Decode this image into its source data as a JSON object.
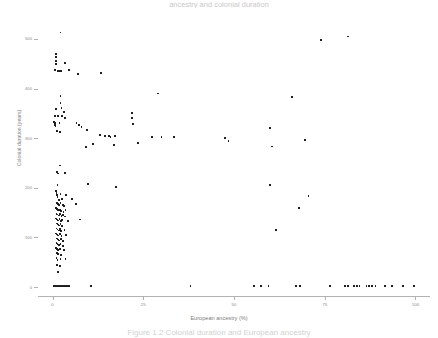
{
  "figure": {
    "top_title_fragment": "ancestry and colonial duration",
    "caption_fragment": "Figure 1.2 Colonial duration and European ancestry"
  },
  "chart_data": {
    "type": "scatter",
    "title": "",
    "xlabel": "European ancestry (%)",
    "ylabel": "Colonial duration (years)",
    "xlim": [
      -4,
      104
    ],
    "ylim": [
      -18,
      530
    ],
    "grid": false,
    "legend": null,
    "xticks": [
      0,
      25,
      50,
      75,
      100
    ],
    "xtick_labels": [
      "0",
      "25",
      "50",
      "75",
      "100"
    ],
    "yticks": [
      0,
      100,
      200,
      300,
      400,
      500
    ],
    "ytick_labels": [
      "0",
      "100",
      "200",
      "300",
      "400",
      "500"
    ],
    "marker": "square",
    "marker_color": "#1b1b1b",
    "marker_size": 1.8,
    "points": [
      [
        2.2,
        513
      ],
      [
        81.5,
        505
      ],
      [
        74.0,
        497
      ],
      [
        0.9,
        470
      ],
      [
        0.9,
        463
      ],
      [
        1.0,
        456
      ],
      [
        0.9,
        449
      ],
      [
        3.4,
        451
      ],
      [
        0.6,
        437
      ],
      [
        1.6,
        436
      ],
      [
        2.1,
        436
      ],
      [
        2.4,
        436
      ],
      [
        4.6,
        437
      ],
      [
        7.0,
        430
      ],
      [
        13.3,
        432
      ],
      [
        2.2,
        385
      ],
      [
        2.2,
        371
      ],
      [
        66.0,
        383
      ],
      [
        29.0,
        390
      ],
      [
        1.0,
        358
      ],
      [
        2.5,
        360
      ],
      [
        3.2,
        352
      ],
      [
        0.7,
        344
      ],
      [
        1.6,
        344
      ],
      [
        2.7,
        345
      ],
      [
        3.4,
        341
      ],
      [
        22.0,
        350
      ],
      [
        22.0,
        340
      ],
      [
        0.5,
        333
      ],
      [
        0.7,
        331
      ],
      [
        0.6,
        327
      ],
      [
        0.8,
        324
      ],
      [
        1.9,
        330
      ],
      [
        22.2,
        328
      ],
      [
        6.6,
        330
      ],
      [
        7.3,
        326
      ],
      [
        8.0,
        322
      ],
      [
        1.3,
        315
      ],
      [
        2.1,
        312
      ],
      [
        9.5,
        316
      ],
      [
        60.0,
        320
      ],
      [
        13.0,
        306
      ],
      [
        14.5,
        304
      ],
      [
        15.5,
        305
      ],
      [
        16.0,
        303
      ],
      [
        17.3,
        305
      ],
      [
        27.5,
        303
      ],
      [
        30.0,
        302
      ],
      [
        33.5,
        303
      ],
      [
        47.5,
        300
      ],
      [
        48.5,
        294
      ],
      [
        69.5,
        297
      ],
      [
        23.5,
        291
      ],
      [
        11.2,
        289
      ],
      [
        17.0,
        287
      ],
      [
        9.3,
        282
      ],
      [
        60.5,
        283
      ],
      [
        2.0,
        245
      ],
      [
        1.3,
        232
      ],
      [
        1.5,
        229
      ],
      [
        3.4,
        230
      ],
      [
        1.4,
        205
      ],
      [
        9.8,
        208
      ],
      [
        17.5,
        202
      ],
      [
        60.0,
        205
      ],
      [
        1.0,
        193
      ],
      [
        1.1,
        189
      ],
      [
        1.2,
        185
      ],
      [
        1.4,
        182
      ],
      [
        2.2,
        188
      ],
      [
        3.8,
        186
      ],
      [
        1.8,
        176
      ],
      [
        2.6,
        177
      ],
      [
        5.3,
        178
      ],
      [
        70.5,
        184
      ],
      [
        1.2,
        170
      ],
      [
        1.5,
        168
      ],
      [
        1.8,
        166
      ],
      [
        2.2,
        170
      ],
      [
        2.8,
        166
      ],
      [
        3.1,
        163
      ],
      [
        6.5,
        167
      ],
      [
        1.0,
        159
      ],
      [
        1.3,
        157
      ],
      [
        1.6,
        155
      ],
      [
        2.0,
        156
      ],
      [
        2.4,
        153
      ],
      [
        3.0,
        152
      ],
      [
        3.6,
        155
      ],
      [
        68.0,
        160
      ],
      [
        1.1,
        148
      ],
      [
        1.4,
        146
      ],
      [
        1.7,
        144
      ],
      [
        2.1,
        147
      ],
      [
        2.5,
        143
      ],
      [
        2.9,
        145
      ],
      [
        3.5,
        142
      ],
      [
        1.0,
        138
      ],
      [
        1.3,
        136
      ],
      [
        1.6,
        134
      ],
      [
        1.9,
        137
      ],
      [
        2.3,
        133
      ],
      [
        2.7,
        135
      ],
      [
        4.2,
        133
      ],
      [
        7.5,
        136
      ],
      [
        1.2,
        128
      ],
      [
        1.5,
        126
      ],
      [
        1.8,
        124
      ],
      [
        2.2,
        127
      ],
      [
        2.6,
        123
      ],
      [
        1.1,
        118
      ],
      [
        1.4,
        116
      ],
      [
        1.7,
        114
      ],
      [
        2.0,
        117
      ],
      [
        2.4,
        113
      ],
      [
        3.3,
        115
      ],
      [
        61.5,
        115
      ],
      [
        1.0,
        108
      ],
      [
        1.3,
        106
      ],
      [
        1.6,
        104
      ],
      [
        2.1,
        107
      ],
      [
        2.5,
        103
      ],
      [
        3.8,
        105
      ],
      [
        1.2,
        98
      ],
      [
        1.5,
        96
      ],
      [
        1.8,
        94
      ],
      [
        2.3,
        97
      ],
      [
        2.8,
        93
      ],
      [
        1.1,
        88
      ],
      [
        1.4,
        86
      ],
      [
        1.7,
        84
      ],
      [
        2.2,
        87
      ],
      [
        2.9,
        83
      ],
      [
        1.0,
        78
      ],
      [
        1.3,
        76
      ],
      [
        1.6,
        74
      ],
      [
        2.0,
        77
      ],
      [
        3.1,
        75
      ],
      [
        1.2,
        68
      ],
      [
        1.5,
        66
      ],
      [
        2.4,
        64
      ],
      [
        1.1,
        58
      ],
      [
        1.4,
        55
      ],
      [
        2.2,
        57
      ],
      [
        3.6,
        56
      ],
      [
        1.3,
        44
      ],
      [
        2.0,
        42
      ],
      [
        1.5,
        30
      ],
      [
        0.5,
        2
      ],
      [
        1.0,
        2
      ],
      [
        1.4,
        2
      ],
      [
        1.8,
        2
      ],
      [
        2.2,
        2
      ],
      [
        2.6,
        2
      ],
      [
        3.0,
        2
      ],
      [
        3.5,
        2
      ],
      [
        4.0,
        2
      ],
      [
        4.6,
        2
      ],
      [
        10.5,
        2
      ],
      [
        38.0,
        2
      ],
      [
        55.5,
        2
      ],
      [
        57.5,
        2
      ],
      [
        59.5,
        2
      ],
      [
        67.0,
        2
      ],
      [
        68.2,
        2
      ],
      [
        76.5,
        2
      ],
      [
        80.5,
        2
      ],
      [
        81.5,
        2
      ],
      [
        83.0,
        2
      ],
      [
        83.8,
        2
      ],
      [
        84.6,
        2
      ],
      [
        86.5,
        2
      ],
      [
        87.3,
        2
      ],
      [
        88.1,
        2
      ],
      [
        89.0,
        2
      ],
      [
        91.5,
        2
      ],
      [
        93.5,
        2
      ],
      [
        96.5,
        2
      ],
      [
        99.5,
        2
      ]
    ]
  }
}
